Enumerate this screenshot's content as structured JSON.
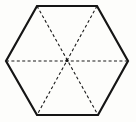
{
  "figure": {
    "name": "regular-hexagon-with-diagonals",
    "canvas": {
      "width": 136,
      "height": 122,
      "background_color": "#fdfdfb"
    },
    "style": {
      "outline_color": "#151515",
      "outline_width": 2.2,
      "diagonal_color": "#1a1a1a",
      "diagonal_width": 1.1,
      "dash_pattern": "3 2.4",
      "center_dot_color": "#151515",
      "center_dot_radius": 1.6
    },
    "center": {
      "label": "center",
      "x": 67,
      "y": 60.5
    },
    "vertices": [
      {
        "label": "left",
        "x": 6,
        "y": 61
      },
      {
        "label": "top-left",
        "x": 37,
        "y": 6
      },
      {
        "label": "top-right",
        "x": 97,
        "y": 6
      },
      {
        "label": "right",
        "x": 128,
        "y": 61
      },
      {
        "label": "bottom-right",
        "x": 98,
        "y": 115
      },
      {
        "label": "bottom-left",
        "x": 37,
        "y": 115
      }
    ],
    "outline_path": "M 6 61 L 37 6 L 97 6 L 128 61 L 98 115 L 37 115 Z",
    "edges": [
      {
        "name": "edge-left-upper",
        "from": "left",
        "to": "top-left",
        "style": "solid"
      },
      {
        "name": "edge-top",
        "from": "top-left",
        "to": "top-right",
        "style": "solid"
      },
      {
        "name": "edge-right-upper",
        "from": "top-right",
        "to": "right",
        "style": "solid"
      },
      {
        "name": "edge-right-lower",
        "from": "right",
        "to": "bottom-right",
        "style": "solid"
      },
      {
        "name": "edge-bottom",
        "from": "bottom-right",
        "to": "bottom-left",
        "style": "solid"
      },
      {
        "name": "edge-left-lower",
        "from": "bottom-left",
        "to": "left",
        "style": "solid"
      }
    ],
    "diagonals": [
      {
        "name": "diagonal-horizontal",
        "from": "left",
        "to": "right",
        "style": "dashed",
        "d": "M 6 61 L 128 61"
      },
      {
        "name": "diagonal-topleft-bottomright",
        "from": "top-left",
        "to": "bottom-right",
        "style": "dashed",
        "d": "M 37 6 L 98 115"
      },
      {
        "name": "diagonal-topright-bottomleft",
        "from": "top-right",
        "to": "bottom-left",
        "style": "dashed",
        "d": "M 97 6 L 37 115"
      }
    ]
  }
}
